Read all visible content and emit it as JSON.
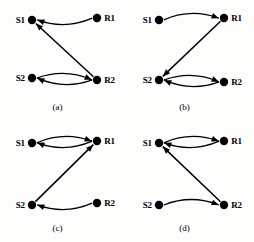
{
  "figure": {
    "background_color": "#fdfdfc",
    "ink_color": "#000000",
    "node_labels": {
      "s1": "S1",
      "r1": "R1",
      "s2": "S2",
      "r2": "R2"
    },
    "panels": [
      {
        "id": "a",
        "caption": "(a)",
        "nodes": [
          {
            "key": "s1",
            "label": "S1",
            "x": 32,
            "y": 20,
            "label_side": "left"
          },
          {
            "key": "r1",
            "label": "R1",
            "x": 97,
            "y": 18,
            "label_side": "right"
          },
          {
            "key": "s2",
            "label": "S2",
            "x": 32,
            "y": 78,
            "label_side": "left"
          },
          {
            "key": "r2",
            "label": "R2",
            "x": 97,
            "y": 80,
            "label_side": "right"
          }
        ],
        "edges": [
          {
            "from": "r1",
            "to": "s1",
            "style": "curve",
            "bow": "down",
            "arrow_at": "s1"
          },
          {
            "from": "s2",
            "to": "r2",
            "style": "curve",
            "bow": "up",
            "arrow_at": "r2"
          },
          {
            "from": "r2",
            "to": "s2",
            "style": "curve",
            "bow": "down",
            "arrow_at": "s2"
          },
          {
            "from": "r2",
            "to": "s1",
            "style": "straight",
            "arrow_at": "s1"
          }
        ]
      },
      {
        "id": "b",
        "caption": "(b)",
        "nodes": [
          {
            "key": "s1",
            "label": "S1",
            "x": 32,
            "y": 20,
            "label_side": "left"
          },
          {
            "key": "r1",
            "label": "R1",
            "x": 97,
            "y": 18,
            "label_side": "right"
          },
          {
            "key": "s2",
            "label": "S2",
            "x": 32,
            "y": 80,
            "label_side": "left"
          },
          {
            "key": "r2",
            "label": "R2",
            "x": 97,
            "y": 82,
            "label_side": "right"
          }
        ],
        "edges": [
          {
            "from": "s1",
            "to": "r1",
            "style": "curve",
            "bow": "up",
            "arrow_at": "r1"
          },
          {
            "from": "s2",
            "to": "r2",
            "style": "curve",
            "bow": "up",
            "arrow_at": "r2"
          },
          {
            "from": "r2",
            "to": "s2",
            "style": "curve",
            "bow": "down",
            "arrow_at": "s2"
          },
          {
            "from": "r1",
            "to": "s2",
            "style": "straight",
            "arrow_at": "s2"
          }
        ]
      },
      {
        "id": "c",
        "caption": "(c)",
        "nodes": [
          {
            "key": "s1",
            "label": "S1",
            "x": 32,
            "y": 22,
            "label_side": "left"
          },
          {
            "key": "r1",
            "label": "R1",
            "x": 97,
            "y": 20,
            "label_side": "right"
          },
          {
            "key": "s2",
            "label": "S2",
            "x": 32,
            "y": 84,
            "label_side": "left"
          },
          {
            "key": "r2",
            "label": "R2",
            "x": 97,
            "y": 82,
            "label_side": "right"
          }
        ],
        "edges": [
          {
            "from": "s1",
            "to": "r1",
            "style": "curve",
            "bow": "up",
            "arrow_at": "r1"
          },
          {
            "from": "r1",
            "to": "s1",
            "style": "curve",
            "bow": "down",
            "arrow_at": "s1"
          },
          {
            "from": "r2",
            "to": "s2",
            "style": "curve",
            "bow": "down",
            "arrow_at": "s2"
          },
          {
            "from": "s2",
            "to": "r1",
            "style": "straight",
            "arrow_at": "r1"
          }
        ]
      },
      {
        "id": "d",
        "caption": "(d)",
        "nodes": [
          {
            "key": "s1",
            "label": "S1",
            "x": 32,
            "y": 22,
            "label_side": "left"
          },
          {
            "key": "r1",
            "label": "R1",
            "x": 97,
            "y": 20,
            "label_side": "right"
          },
          {
            "key": "s2",
            "label": "S2",
            "x": 32,
            "y": 84,
            "label_side": "left"
          },
          {
            "key": "r2",
            "label": "R2",
            "x": 97,
            "y": 84,
            "label_side": "right"
          }
        ],
        "edges": [
          {
            "from": "s1",
            "to": "r1",
            "style": "curve",
            "bow": "up",
            "arrow_at": "r1"
          },
          {
            "from": "r1",
            "to": "s1",
            "style": "curve",
            "bow": "down",
            "arrow_at": "s1"
          },
          {
            "from": "s2",
            "to": "r2",
            "style": "curve",
            "bow": "up",
            "arrow_at": "r2"
          },
          {
            "from": "r2",
            "to": "s1",
            "style": "straight",
            "arrow_at": "s1"
          }
        ]
      }
    ]
  }
}
